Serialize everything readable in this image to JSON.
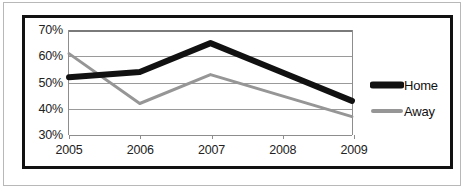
{
  "chart_data": {
    "type": "line",
    "title": "",
    "xlabel": "",
    "ylabel": "",
    "categories": [
      "2005",
      "2006",
      "2007",
      "2008",
      "2009"
    ],
    "x": [
      2005,
      2006,
      2007,
      2008,
      2009
    ],
    "ylim": [
      30,
      70
    ],
    "ytick_labels": [
      "30%",
      "40%",
      "50%",
      "60%",
      "70%"
    ],
    "yticks": [
      30,
      40,
      50,
      60,
      70
    ],
    "grid": true,
    "legend_position": "right",
    "series": [
      {
        "name": "Home",
        "color": "#111111",
        "line_width": 6,
        "values": [
          52,
          54,
          65,
          54,
          43
        ]
      },
      {
        "name": "Away",
        "color": "#969696",
        "line_width": 3,
        "values": [
          61,
          42,
          53,
          45,
          37
        ]
      }
    ]
  },
  "legend": {
    "items": [
      {
        "label": "Home"
      },
      {
        "label": "Away"
      }
    ]
  },
  "colors": {
    "home": "#111111",
    "away": "#969696",
    "grid": "#9a9a9a",
    "frame": "#111111",
    "outer_frame": "#b8b8b8",
    "text": "#222222",
    "background": "#ffffff"
  }
}
